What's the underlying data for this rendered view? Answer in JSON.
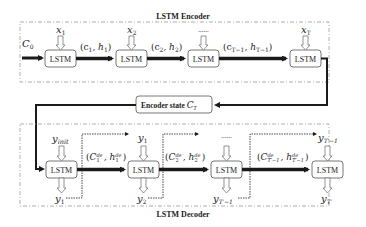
{
  "diagram": {
    "encoder": {
      "title": "LSTM Encoder",
      "initial_state": "C",
      "initial_state_sub": "0",
      "cells": [
        {
          "label": "LSTM",
          "input": "x",
          "input_sub": "1"
        },
        {
          "label": "LSTM",
          "input": "x",
          "input_sub": "2"
        },
        {
          "label": "LSTM",
          "input": "......",
          "input_sub": ""
        },
        {
          "label": "LSTM",
          "input": "x",
          "input_sub": "T"
        }
      ],
      "states": [
        {
          "text": "(c",
          "sub1": "1",
          "mid": ", h",
          "sub2": "1",
          "end": ")"
        },
        {
          "text": "(c",
          "sub1": "2",
          "mid": ", h",
          "sub2": "2",
          "end": ")"
        },
        {
          "text": "(c",
          "sub1": "T−1",
          "mid": ", h",
          "sub2": "T−1",
          "end": ")"
        }
      ]
    },
    "encoder_state": {
      "label": "Encoder state ",
      "symbol": "C",
      "symbol_sub": "T"
    },
    "decoder": {
      "title": "LSTM Decoder",
      "cells": [
        {
          "label": "LSTM",
          "input": "y",
          "input_sub": "init",
          "output": "y",
          "output_sub": "1"
        },
        {
          "label": "LSTM",
          "input": "y",
          "input_sub": "1",
          "output": "y",
          "output_sub": "2"
        },
        {
          "label": "LSTM",
          "input": "......",
          "input_sub": "",
          "output": "y",
          "output_sub": "T′−1"
        },
        {
          "label": "LSTM",
          "input": "y",
          "input_sub": "T′−1",
          "output": "y",
          "output_sub": "T′"
        }
      ],
      "states": [
        {
          "c_sub": "1",
          "h_sub": "1",
          "sup": "de"
        },
        {
          "c_sub": "2",
          "h_sub": "2",
          "sup": "de"
        },
        {
          "c_sub": "T′−1",
          "h_sub": "T′−1",
          "sup": "de"
        }
      ]
    },
    "colors": {
      "line": "#1a1a1a",
      "box_border": "#555555",
      "dashed": "#888888"
    }
  }
}
